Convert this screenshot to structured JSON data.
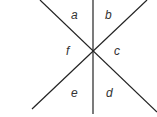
{
  "diagram": {
    "type": "intersecting-lines-angles",
    "line_color": "#222222",
    "label_color": "#333333",
    "intersection": {
      "x": 93,
      "y": 50
    },
    "lines": [
      {
        "id": "vertical",
        "x1": 93,
        "y1": 0,
        "x2": 93,
        "y2": 114
      },
      {
        "id": "diag-down",
        "x1": 40,
        "y1": 0,
        "x2": 157,
        "y2": 112
      },
      {
        "id": "diag-up",
        "x1": 147,
        "y1": 0,
        "x2": 32,
        "y2": 109
      }
    ],
    "angles": [
      {
        "label": "a",
        "x": 71,
        "y": 19
      },
      {
        "label": "b",
        "x": 105,
        "y": 19
      },
      {
        "label": "c",
        "x": 114,
        "y": 55
      },
      {
        "label": "d",
        "x": 106,
        "y": 97
      },
      {
        "label": "e",
        "x": 71,
        "y": 97
      },
      {
        "label": "f",
        "x": 66,
        "y": 55
      }
    ]
  }
}
